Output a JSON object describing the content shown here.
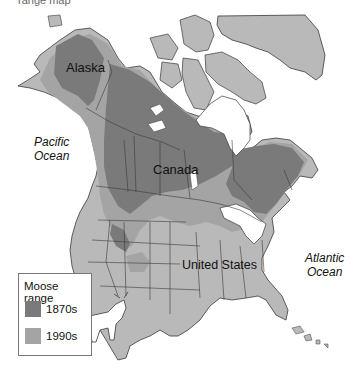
{
  "map": {
    "top_cut_text": "range map",
    "labels": {
      "alaska": "Alaska",
      "canada": "Canada",
      "united_states": "United States",
      "pacific": [
        "Pacific",
        "Ocean"
      ],
      "atlantic": [
        "Atlantic",
        "Ocean"
      ]
    },
    "legend": {
      "title": "Moose range",
      "items": [
        {
          "label": "1870s",
          "color": "#7a7a7a"
        },
        {
          "label": "1990s",
          "color": "#a4a4a4"
        }
      ]
    },
    "colors": {
      "land": "#b9b9b9",
      "range_1870s": "#7a7a7a",
      "range_1990s": "#a4a4a4",
      "water": "#ffffff",
      "border": "#3a3a3a"
    }
  }
}
